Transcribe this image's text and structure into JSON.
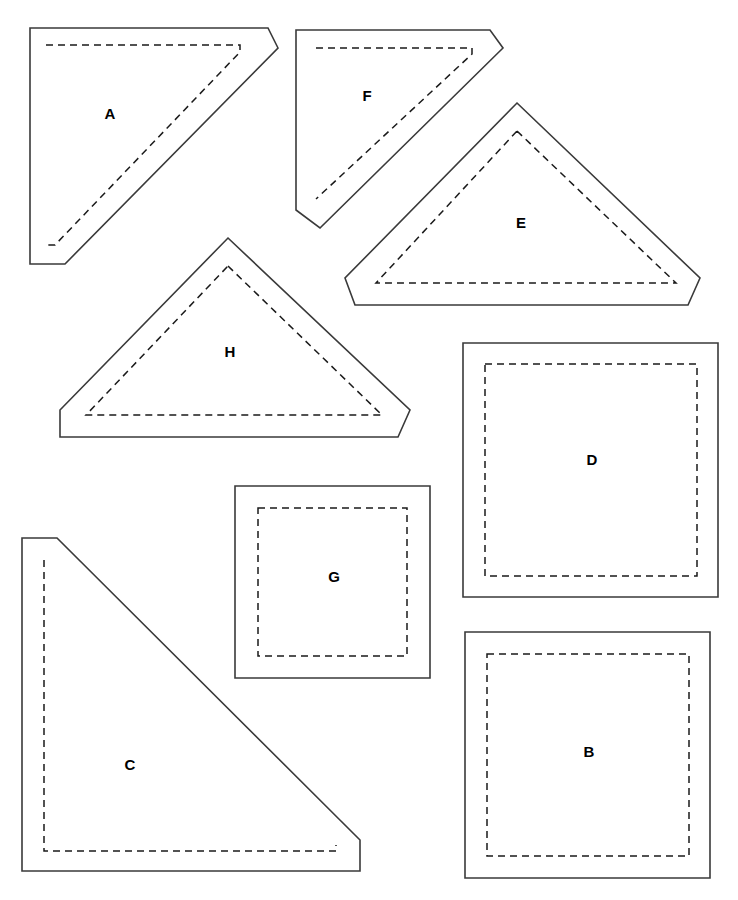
{
  "document": {
    "kind": "sewing-pattern-template-sheet",
    "background_color": "#ffffff",
    "cut_line_color": "#3a3a3a",
    "seam_line_color": "#1a1a1a",
    "label_color": "#000000",
    "width": 738,
    "height": 900
  },
  "pieces": [
    {
      "id": "A",
      "label": "A",
      "shape": "right-triangle-blunted-corners",
      "label_x": 110,
      "label_y": 115,
      "cut_points": "30,28 268,28 278,48 65,264 30,264",
      "seam_points": "46,45 240,45 240,52 55,245 46,245"
    },
    {
      "id": "F",
      "label": "F",
      "shape": "right-triangle-blunted-corners",
      "label_x": 367,
      "label_y": 97,
      "cut_points": "296,30 490,30 503,48 320,228 296,210"
    },
    {
      "id": "F_seam",
      "label": "",
      "shape": "seam-only",
      "seam_points": "316,48 472,48 472,54 316,199"
    },
    {
      "id": "E",
      "label": "E",
      "shape": "isoceles-triangle-blunted-corners",
      "label_x": 521,
      "label_y": 224,
      "cut_points": "517,103 700,278 688,305 355,305 345,278",
      "seam_points": "517,131 676,283 376,283"
    },
    {
      "id": "H",
      "label": "H",
      "shape": "isoceles-triangle-blunted-corners",
      "label_x": 230,
      "label_y": 353,
      "cut_points": "228,238 410,410 398,437 60,437 60,410",
      "seam_points": "228,266 382,415 86,415"
    },
    {
      "id": "D",
      "label": "D",
      "shape": "square",
      "label_x": 592,
      "label_y": 461,
      "cut_points": "463,343 718,343 718,597 463,597",
      "seam_points": "485,364 697,364 697,576 485,576"
    },
    {
      "id": "G",
      "label": "G",
      "shape": "square",
      "label_x": 334,
      "label_y": 578,
      "cut_points": "235,486 430,486 430,678 235,678",
      "seam_points": "258,508 407,508 407,656 258,656"
    },
    {
      "id": "C",
      "label": "C",
      "shape": "right-triangle-blunted-corners",
      "label_x": 130,
      "label_y": 766,
      "cut_points": "22,538 57,538 360,840 360,871 22,871",
      "seam_points": "44,560 44,851 336,851 336,845"
    },
    {
      "id": "B",
      "label": "B",
      "shape": "square",
      "label_x": 589,
      "label_y": 753,
      "cut_points": "465,632 710,632 710,878 465,878",
      "seam_points": "487,654 689,654 689,856 487,856"
    }
  ]
}
